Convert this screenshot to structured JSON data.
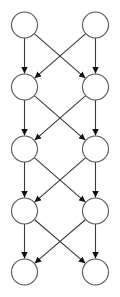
{
  "diagram": {
    "type": "directed-graph",
    "layout": "layered",
    "canvas": {
      "width": 120,
      "height": 297
    },
    "colors": {
      "background": "#ffffff",
      "node_fill": "#ffffff",
      "node_stroke": "#555555",
      "edge_stroke": "#3a3a3a",
      "arrowhead": "#111111"
    },
    "node_radius": 13,
    "columns_x": [
      24.5,
      95.5
    ],
    "rows_y": [
      25,
      87,
      149,
      211,
      272
    ],
    "nodes": [
      {
        "id": "r1c1",
        "label": "",
        "row": 0,
        "col": 0
      },
      {
        "id": "r1c2",
        "label": "",
        "row": 0,
        "col": 1
      },
      {
        "id": "r2c1",
        "label": "",
        "row": 1,
        "col": 0
      },
      {
        "id": "r2c2",
        "label": "",
        "row": 1,
        "col": 1
      },
      {
        "id": "r3c1",
        "label": "",
        "row": 2,
        "col": 0
      },
      {
        "id": "r3c2",
        "label": "",
        "row": 2,
        "col": 1
      },
      {
        "id": "r4c1",
        "label": "",
        "row": 3,
        "col": 0
      },
      {
        "id": "r4c2",
        "label": "",
        "row": 3,
        "col": 1
      },
      {
        "id": "r5c1",
        "label": "",
        "row": 4,
        "col": 0
      },
      {
        "id": "r5c2",
        "label": "",
        "row": 4,
        "col": 1
      }
    ],
    "edges": [
      {
        "from": "r1c1",
        "to": "r2c1"
      },
      {
        "from": "r1c1",
        "to": "r2c2"
      },
      {
        "from": "r1c2",
        "to": "r2c1"
      },
      {
        "from": "r1c2",
        "to": "r2c2"
      },
      {
        "from": "r2c1",
        "to": "r3c1"
      },
      {
        "from": "r2c1",
        "to": "r3c2"
      },
      {
        "from": "r2c2",
        "to": "r3c1"
      },
      {
        "from": "r2c2",
        "to": "r3c2"
      },
      {
        "from": "r3c1",
        "to": "r4c1"
      },
      {
        "from": "r3c1",
        "to": "r4c2"
      },
      {
        "from": "r3c2",
        "to": "r4c1"
      },
      {
        "from": "r3c2",
        "to": "r4c2"
      },
      {
        "from": "r4c1",
        "to": "r5c1"
      },
      {
        "from": "r4c1",
        "to": "r5c2"
      },
      {
        "from": "r4c2",
        "to": "r5c1"
      },
      {
        "from": "r4c2",
        "to": "r5c2"
      }
    ]
  }
}
